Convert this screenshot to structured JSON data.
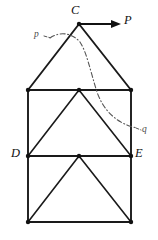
{
  "figure": {
    "kind": "structural-truss-diagram",
    "width": 158,
    "height": 240,
    "background_color": "#ffffff",
    "line_color": "#1a1a1a",
    "section_line_color": "#555555"
  },
  "labels": {
    "apex": "C",
    "force": "P",
    "section_start": "p",
    "section_end": "q",
    "left_chord_node": "D",
    "right_chord_node": "E"
  },
  "geometry": {
    "apex": {
      "x": 79,
      "y": 24
    },
    "top_left": {
      "x": 28,
      "y": 90
    },
    "top_right": {
      "x": 131,
      "y": 90
    },
    "mid_left": {
      "x": 28,
      "y": 156
    },
    "mid_right": {
      "x": 131,
      "y": 156
    },
    "bottom_left": {
      "x": 28,
      "y": 222
    },
    "bottom_right": {
      "x": 131,
      "y": 222
    },
    "upper_inner_apex": {
      "x": 79,
      "y": 90
    },
    "lower_inner_apex": {
      "x": 79,
      "y": 156
    },
    "force_arrow": {
      "x1": 79,
      "y1": 24,
      "x2": 114,
      "y2": 24,
      "tip_x": 121
    },
    "section_curve": "M 50,38 C 60,31 72,33 80,42 C 87,53 90,70 97,92 C 104,112 118,124 137,128"
  },
  "label_positions": {
    "apex": {
      "left": 71,
      "top": 4
    },
    "force": {
      "left": 124,
      "top": 14
    },
    "section_start": {
      "left": 34,
      "top": 30
    },
    "section_end": {
      "left": 142,
      "top": 125
    },
    "left_chord_node": {
      "left": 11,
      "top": 147
    },
    "right_chord_node": {
      "left": 135,
      "top": 147
    }
  }
}
